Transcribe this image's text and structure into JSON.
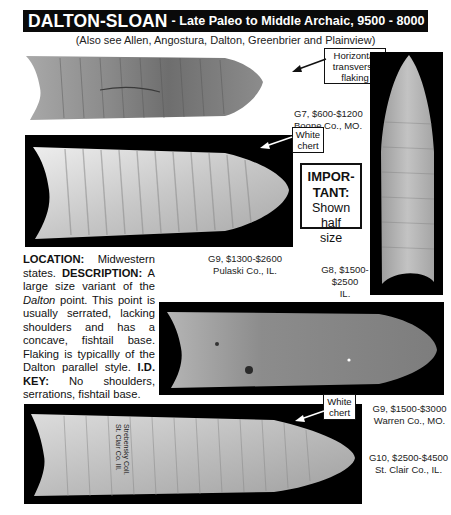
{
  "header": {
    "title": "DALTON-SLOAN",
    "subtitle": " - Late Paleo to Middle Archaic, 9500 - 8000 B. P.",
    "see_also": "(Also see Allen, Angostura, Dalton, Greenbrier and Plainview)"
  },
  "specimens": [
    {
      "id": "top-left",
      "grade_value": "G7, $600-$1200",
      "location": "Boone Co., MO."
    },
    {
      "id": "second",
      "grade_value": "G9, $1300-$2600",
      "location": "Pulaski Co., IL."
    },
    {
      "id": "vertical",
      "grade_value_line1": "G8, $1500-",
      "grade_value_line2": "$2500",
      "location": "IL."
    },
    {
      "id": "fourth",
      "grade_value": "G9, $1500-$3000",
      "location": "Warren Co., MO."
    },
    {
      "id": "bottom",
      "grade_value": "G10, $2500-$4500",
      "location": "St. Clair Co., IL.",
      "inscription_line1": "St. Clair Co. Ill.",
      "inscription_line2": "Strebensky Coll."
    }
  ],
  "callouts": {
    "horizontal_line1": "Horizontal",
    "horizontal_line2": "transverse",
    "horizontal_line3": "flaking",
    "white_chert_1_line1": "White",
    "white_chert_1_line2": "chert",
    "white_chert_2_line1": "White",
    "white_chert_2_line2": "chert"
  },
  "important_box": {
    "line1": "IMPOR-",
    "line2": "TANT:",
    "line3": "Shown half",
    "line4": "size"
  },
  "description": {
    "location_label": "LOCATION:",
    "location_text": " Midwestern states. ",
    "description_label": "DESCRIPTION:",
    "description_text_1": " A large size variant of the ",
    "description_italic": "Dalton",
    "description_text_2": " point. This point is usually serrated, lacking shoulders and has a concave, fishtail base. Flaking is typicallly of the Dalton parallel style. ",
    "idkey_label": "I.D. KEY:",
    "idkey_text": " No shoulders, serrations, fishtail base."
  },
  "colors": {
    "header_bg": "#0a0a0a",
    "header_text": "#ffffff",
    "photo_bg": "#000000",
    "page_bg": "#ffffff"
  }
}
